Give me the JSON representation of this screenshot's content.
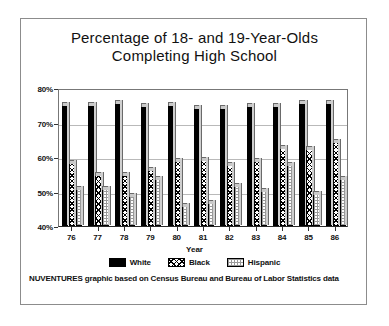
{
  "chart_data": {
    "type": "bar",
    "title": "Percentage of 18- and 19-Year-Olds Completing High School",
    "title_line1": "Percentage of 18- and 19-Year-Olds",
    "title_line2": "Completing High School",
    "xlabel": "Year",
    "ylabel": "",
    "categories": [
      "76",
      "77",
      "78",
      "79",
      "80",
      "81",
      "82",
      "83",
      "84",
      "85",
      "86"
    ],
    "ylim": [
      40,
      80
    ],
    "yticks": [
      "40%",
      "50%",
      "60%",
      "70%",
      "80%"
    ],
    "ytick_values": [
      40,
      50,
      60,
      70,
      80
    ],
    "grid": true,
    "legend_position": "bottom",
    "series": [
      {
        "name": "White",
        "fill": "solid-black",
        "values": [
          75.5,
          75.5,
          76.0,
          75.0,
          75.5,
          74.5,
          74.5,
          75.0,
          75.0,
          76.0,
          76.0
        ]
      },
      {
        "name": "Black",
        "fill": "diagonal-hatch",
        "values": [
          58.5,
          55.0,
          55.0,
          56.5,
          59.0,
          59.5,
          58.0,
          59.0,
          63.0,
          62.5,
          64.5
        ]
      },
      {
        "name": "Hispanic",
        "fill": "light-stipple",
        "values": [
          51.0,
          51.0,
          49.0,
          54.0,
          46.0,
          47.0,
          52.0,
          50.5,
          58.0,
          49.5,
          54.0
        ]
      }
    ],
    "annotations": [
      "NUVENTURES graphic based on Census Bureau and Bureau of Labor Statistics data"
    ]
  },
  "footnote": {
    "text": "NUVENTURES graphic based on Census Bureau and Bureau of  Labor Statistics data"
  },
  "colors": {
    "white_series": "#000000",
    "black_series": "#ffffff",
    "hispanic_series": "#ffffff",
    "frame": "#8c8c8c",
    "grid": "#b9b9b9",
    "text": "#111111"
  }
}
